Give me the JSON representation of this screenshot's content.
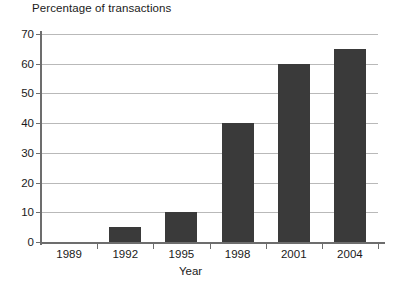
{
  "chart_data": {
    "type": "bar",
    "title": "",
    "ylabel": "Percentage of transactions",
    "xlabel": "Year",
    "categories": [
      "1989",
      "1992",
      "1995",
      "1998",
      "2001",
      "2004"
    ],
    "values": [
      0,
      5,
      10,
      40,
      60,
      65
    ],
    "series": [
      {
        "name": "Percentage of transactions",
        "values": [
          0,
          5,
          10,
          40,
          60,
          65
        ]
      }
    ],
    "ylim": [
      0,
      70
    ],
    "ytick_labels": [
      "0",
      "10",
      "20",
      "30",
      "40",
      "50",
      "60",
      "70"
    ],
    "ytick_values": [
      0,
      10,
      20,
      30,
      40,
      50,
      60,
      70
    ],
    "grid": true,
    "legend": false,
    "legend_position": "none",
    "bar_color": "#3a3a3a",
    "gridline_color": "#b9b9b9",
    "axis_color": "#6d6d6d",
    "background_color": "#ffffff"
  }
}
